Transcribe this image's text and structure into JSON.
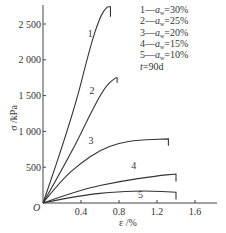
{
  "chart_data": {
    "type": "line",
    "title": "",
    "xlabel": "ε /%",
    "ylabel": "σ /kPa",
    "origin_label": "O",
    "xlim": [
      0,
      1.8
    ],
    "ylim": [
      0,
      2780
    ],
    "grid": false,
    "x_ticks": [
      0.4,
      0.8,
      1.2,
      1.6
    ],
    "x_tick_labels": [
      "0.4",
      "0.8",
      "1.2",
      "1.6"
    ],
    "y_ticks": [
      500,
      1000,
      1500,
      2000,
      2500
    ],
    "y_tick_labels": [
      "500",
      "1 000",
      "1 500",
      "2 000",
      "2 500"
    ],
    "legend_position": "top-right",
    "legend": [
      "1—a_w=30%",
      "2—a_w=25%",
      "3—a_w=20%",
      "4—a_w=15%",
      "5—a_w=10%",
      "t=90d"
    ],
    "series": [
      {
        "name": "1",
        "label": "a_w=30%",
        "x": [
          0,
          0.3,
          0.5,
          0.6,
          0.67,
          0.71,
          0.71
        ],
        "y": [
          0,
          1150,
          2200,
          2600,
          2740,
          2740,
          2600
        ]
      },
      {
        "name": "2",
        "label": "a_w=25%",
        "x": [
          0,
          0.3,
          0.5,
          0.65,
          0.76,
          0.78,
          0.78
        ],
        "y": [
          0,
          700,
          1250,
          1620,
          1750,
          1750,
          1680
        ]
      },
      {
        "name": "3",
        "label": "a_w=20%",
        "x": [
          0,
          0.2,
          0.4,
          0.6,
          0.8,
          1.0,
          1.32,
          1.32
        ],
        "y": [
          0,
          330,
          560,
          740,
          840,
          880,
          895,
          800
        ]
      },
      {
        "name": "4",
        "label": "a_w=15%",
        "x": [
          0,
          0.4,
          0.8,
          1.2,
          1.4,
          1.4
        ],
        "y": [
          0,
          190,
          300,
          380,
          405,
          300
        ]
      },
      {
        "name": "5",
        "label": "a_w=10%",
        "x": [
          0,
          0.4,
          0.8,
          1.1,
          1.4,
          1.4
        ],
        "y": [
          0,
          110,
          160,
          170,
          150,
          50
        ]
      }
    ],
    "curve_labels": [
      {
        "text": "1",
        "x": 0.47,
        "y": 2320
      },
      {
        "text": "2",
        "x": 0.49,
        "y": 1520
      },
      {
        "text": "3",
        "x": 0.48,
        "y": 830
      },
      {
        "text": "4",
        "x": 0.93,
        "y": 470
      },
      {
        "text": "5",
        "x": 1.0,
        "y": 75
      }
    ]
  }
}
